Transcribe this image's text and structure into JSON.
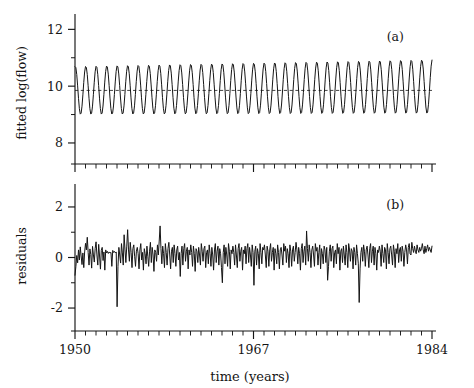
{
  "figure": {
    "background": "#ffffff",
    "ink": "#151515",
    "xlabel": "time  (years)",
    "panel_tags": [
      "(a)",
      "(b)"
    ]
  },
  "chart_data": [
    {
      "type": "line",
      "panel": "(a)",
      "title": "",
      "xlabel": "time  (years)",
      "ylabel": "fitted log(flow)",
      "xlim": [
        1950,
        1984
      ],
      "ylim": [
        7.4,
        12.4
      ],
      "yticks": [
        8,
        10,
        12
      ],
      "ytick_labels": [
        "8",
        "10",
        "12"
      ],
      "yminor_ticks": [
        9,
        11
      ],
      "xticks": [
        1950,
        1967,
        1984
      ],
      "xtick_labels": [
        "1950",
        "1967",
        "1984"
      ],
      "xminor_step": 1,
      "grid": false,
      "legend": null,
      "annotations": [
        {
          "text": "(a)",
          "x": 1980.5,
          "y": 11.6
        }
      ],
      "series": [
        {
          "name": "fitted log(flow)",
          "description": "regular annual seasonal sinusoid, slowly growing amplitude",
          "mean_level": 9.85,
          "amplitude_start": 0.85,
          "amplitude_end": 0.95,
          "period_years": 1.0,
          "trend_per_year": 0.004,
          "phase_offset": 0.22,
          "points_per_year": 12,
          "peak_range": [
            10.55,
            10.78
          ],
          "trough_range": [
            8.82,
            9.02
          ]
        },
        {
          "name": "mean level",
          "description": "horizontal dashed reference line at the fitted mean",
          "style": "dashed",
          "value": 9.85
        }
      ]
    },
    {
      "type": "line",
      "panel": "(b)",
      "title": "",
      "xlabel": "time  (years)",
      "ylabel": "residuals",
      "xlim": [
        1950,
        1984
      ],
      "ylim": [
        -2.75,
        2.75
      ],
      "yticks": [
        -2,
        0,
        2
      ],
      "ytick_labels": [
        "-2",
        "0",
        "2"
      ],
      "yminor_ticks": [
        -1,
        1
      ],
      "xticks": [
        1950,
        1967,
        1984
      ],
      "xtick_labels": [
        "1950",
        "1967",
        "1984"
      ],
      "xminor_step": 1,
      "grid": false,
      "legend": null,
      "annotations": [
        {
          "text": "(b)",
          "x": 1980.5,
          "y": 1.9
        }
      ],
      "series": [
        {
          "name": "residuals",
          "description": "monthly residual series, mean ~0, sd ~0.4, two large negative spikes near 1954 and 1978",
          "n_points": 408,
          "mean": 0.0,
          "sd": 0.4,
          "min": -1.95,
          "max": 1.25,
          "spikes": [
            {
              "x": 1954.0,
              "y": -1.95
            },
            {
              "x": 1977.9,
              "y": -1.78
            }
          ],
          "values": [
            -0.7,
            -0.36,
            0.08,
            -0.21,
            0.3,
            -0.1,
            0.42,
            0.06,
            -0.28,
            0.18,
            -0.4,
            0.22,
            0.56,
            0.3,
            0.8,
            0.2,
            -0.3,
            0.34,
            0.12,
            -0.42,
            0.44,
            0.1,
            -0.18,
            0.36,
            0.62,
            0.1,
            -0.3,
            0.52,
            0.06,
            -0.46,
            0.28,
            0.4,
            -0.12,
            0.22,
            -0.5,
            0.3,
            0.18,
            0.24,
            0.16,
            0.22,
            0.18,
            0.2,
            -0.35,
            0.28,
            0.2,
            0.24,
            0.18,
            0.22,
            -1.95,
            -0.35,
            0.4,
            0.1,
            -0.22,
            0.55,
            0.18,
            -0.3,
            0.9,
            0.3,
            -0.2,
            0.45,
            1.1,
            0.3,
            -0.15,
            0.6,
            0.2,
            -0.4,
            0.35,
            0.5,
            0.05,
            -0.35,
            0.25,
            0.4,
            0.15,
            -0.45,
            0.3,
            0.55,
            -0.1,
            0.2,
            -0.5,
            0.35,
            0.15,
            -0.25,
            0.45,
            0.05,
            -0.35,
            0.25,
            0.6,
            -0.2,
            0.4,
            0.1,
            -0.55,
            0.3,
            0.2,
            -0.15,
            0.5,
            0.1,
            0.65,
            1.25,
            0.35,
            -0.25,
            0.45,
            0.15,
            -0.4,
            0.55,
            0.2,
            -0.3,
            0.35,
            0.6,
            0.1,
            -0.45,
            0.25,
            0.4,
            -0.2,
            0.5,
            0.15,
            -0.35,
            0.3,
            0.45,
            -0.1,
            0.2,
            -0.75,
            0.15,
            0.45,
            -0.3,
            0.35,
            0.55,
            -0.15,
            0.25,
            0.4,
            -0.45,
            0.3,
            0.1,
            0.5,
            0.2,
            -0.35,
            0.45,
            0.15,
            -0.55,
            0.35,
            0.25,
            -0.2,
            0.4,
            0.1,
            -0.3,
            0.55,
            0.25,
            -0.15,
            0.35,
            0.45,
            -0.4,
            0.2,
            0.3,
            -0.25,
            0.5,
            0.15,
            -0.35,
            0.4,
            0.1,
            -0.5,
            0.3,
            0.55,
            -0.2,
            0.25,
            0.45,
            -0.3,
            0.35,
            0.15,
            -0.4,
            -1.0,
            0.2,
            0.5,
            -0.25,
            0.4,
            0.1,
            -0.35,
            0.55,
            0.25,
            -0.45,
            0.3,
            0.15,
            0.45,
            0.2,
            -0.3,
            0.5,
            0.1,
            -0.4,
            0.35,
            0.55,
            -0.15,
            0.25,
            0.4,
            -0.5,
            0.3,
            0.15,
            0.45,
            -0.25,
            0.35,
            0.55,
            -0.2,
            0.4,
            0.1,
            -0.35,
            0.5,
            0.2,
            -1.1,
            0.25,
            0.45,
            -0.3,
            0.35,
            0.15,
            -0.45,
            0.55,
            0.2,
            -0.25,
            0.4,
            0.3,
            0.5,
            0.1,
            -0.4,
            0.45,
            0.25,
            -0.35,
            0.3,
            0.55,
            -0.15,
            0.2,
            0.4,
            -0.5,
            0.35,
            0.15,
            -0.25,
            0.5,
            0.2,
            -0.45,
            0.3,
            0.4,
            0.1,
            -0.3,
            0.55,
            0.25,
            0.45,
            -0.2,
            0.35,
            0.15,
            -0.4,
            0.5,
            0.25,
            -0.35,
            0.3,
            0.45,
            -0.15,
            0.2,
            0.6,
            0.3,
            -0.25,
            0.4,
            0.15,
            -0.5,
            0.35,
            0.55,
            -0.2,
            0.25,
            0.45,
            -0.3,
            1.05,
            0.35,
            -0.15,
            0.5,
            0.2,
            -0.4,
            0.3,
            0.45,
            0.1,
            -0.35,
            0.55,
            0.25,
            0.4,
            -0.3,
            0.2,
            0.5,
            -0.45,
            0.35,
            0.15,
            -0.25,
            0.45,
            0.3,
            -0.2,
            0.4,
            -0.9,
            -0.35,
            0.25,
            0.5,
            -0.15,
            0.35,
            0.45,
            -0.4,
            0.2,
            0.3,
            -0.25,
            0.55,
            0.15,
            0.4,
            -0.5,
            0.25,
            0.35,
            -0.2,
            0.45,
            0.1,
            -0.3,
            0.5,
            0.2,
            -0.4,
            0.55,
            0.3,
            -0.15,
            0.35,
            0.25,
            -0.45,
            0.4,
            0.2,
            -0.3,
            0.5,
            0.15,
            -0.25,
            -1.78,
            -0.45,
            0.2,
            0.4,
            -0.15,
            0.5,
            0.25,
            -0.35,
            0.3,
            0.45,
            0.1,
            -0.4,
            0.35,
            0.55,
            -0.2,
            0.25,
            0.45,
            -0.3,
            0.4,
            0.15,
            -0.5,
            0.3,
            0.2,
            0.45,
            0.25,
            -0.35,
            0.5,
            0.15,
            -0.2,
            0.4,
            0.3,
            -0.45,
            0.55,
            0.2,
            -0.25,
            0.35,
            0.45,
            0.1,
            -0.3,
            0.5,
            0.25,
            -0.4,
            0.35,
            0.15,
            0.55,
            -0.2,
            0.3,
            0.4,
            -0.15,
            0.45,
            0.25,
            -0.35,
            0.2,
            0.5,
            0.3,
            -0.25,
            0.4,
            0.55,
            0.15,
            0.1,
            0.6,
            0.35,
            0.2,
            0.45,
            0.25,
            0.15,
            0.5,
            0.3,
            0.2,
            0.4,
            0.25,
            0.35,
            0.55,
            0.3,
            0.15,
            0.45,
            0.2,
            0.35,
            0.5,
            0.25,
            0.4,
            0.3,
            0.2,
            0.45
          ]
        }
      ]
    }
  ]
}
